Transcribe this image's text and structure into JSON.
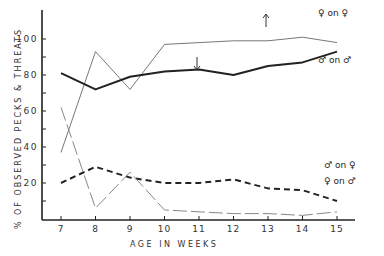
{
  "chart_data": {
    "type": "line",
    "title": "",
    "xlabel": "AGE IN WEEKS",
    "ylabel": "% OF OBSERVED PECKS & THREATS",
    "x": [
      7,
      8,
      9,
      10,
      11,
      12,
      13,
      14,
      15
    ],
    "xticks": [
      "7",
      "8",
      "9",
      "10",
      "11",
      "12",
      "13",
      "14",
      "15"
    ],
    "yticks": [
      "20",
      "40",
      "60",
      "80",
      "100"
    ],
    "ylim": [
      0,
      105
    ],
    "grid": false,
    "legend_position": "inline-right",
    "series": [
      {
        "name": "♀ on ♀",
        "style": "thin-solid",
        "color": "#777777",
        "values": [
          37,
          93,
          72,
          97,
          98,
          99,
          99,
          101,
          98
        ]
      },
      {
        "name": "♂ on ♂",
        "style": "thick-solid",
        "color": "#222222",
        "values": [
          81,
          72,
          79,
          82,
          83,
          80,
          85,
          87,
          93
        ]
      },
      {
        "name": "♂ on ♀",
        "style": "thick-dashed",
        "color": "#222222",
        "values": [
          20,
          29,
          23,
          20,
          20,
          22,
          17,
          16,
          10
        ]
      },
      {
        "name": "♀ on ♂",
        "style": "thin-long-dashed",
        "color": "#888888",
        "values": [
          62,
          6,
          26,
          5,
          4,
          3,
          3,
          2,
          4
        ]
      }
    ],
    "annotations": [
      {
        "type": "arrow-down",
        "x": 11,
        "label": ""
      },
      {
        "type": "arrow-up",
        "x": 13,
        "label": ""
      }
    ]
  }
}
